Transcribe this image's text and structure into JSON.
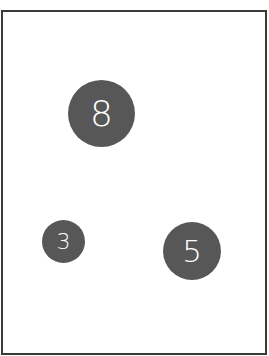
{
  "board": {
    "border_color": "#3a3a3a",
    "background": "#ffffff"
  },
  "balls": [
    {
      "label": "8",
      "color": "#575757",
      "text_color": "#ffffff"
    },
    {
      "label": "3",
      "color": "#575757",
      "text_color": "#ffffff"
    },
    {
      "label": "5",
      "color": "#575757",
      "text_color": "#ffffff"
    }
  ]
}
